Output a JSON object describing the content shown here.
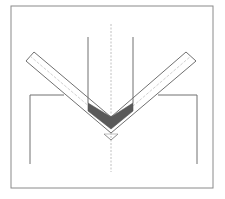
{
  "diagram": {
    "title": "",
    "type": "press-brake-v-bending",
    "colors": {
      "background": "#ffffff",
      "frame": "#8a8a8a",
      "line": "#707070",
      "centerline": "#b0b0b0",
      "sheet_midline": "#c4c4c4",
      "punch_tip_fill": "#5a5a5a"
    },
    "components": [
      {
        "id": "frame",
        "label": "border frame"
      },
      {
        "id": "punch",
        "label": "punch"
      },
      {
        "id": "die",
        "label": "V-die"
      },
      {
        "id": "sheet",
        "label": "bent sheet"
      },
      {
        "id": "centerline",
        "label": "vertical centerline"
      }
    ]
  }
}
